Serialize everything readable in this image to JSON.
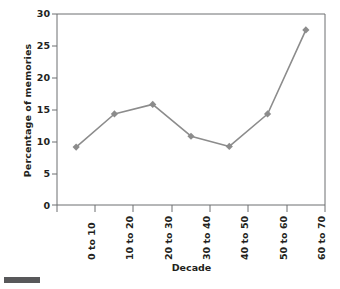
{
  "chart_data": {
    "type": "line",
    "title": "",
    "subtitle": "",
    "xlabel": "Decade",
    "ylabel": "Percentage of memories",
    "categories": [
      "0 to 10",
      "10 to 20",
      "20 to 30",
      "30 to 40",
      "40 to 50",
      "50 to 60",
      "60 to 70"
    ],
    "values": [
      9.1,
      14.3,
      15.8,
      10.8,
      9.2,
      14.3,
      27.5
    ],
    "series": [
      {
        "name": "Percentage of memories",
        "values": [
          9.1,
          14.3,
          15.8,
          10.8,
          9.2,
          14.3,
          27.5
        ]
      }
    ],
    "ylim": [
      0,
      30
    ],
    "y_ticks": [
      0,
      5,
      10,
      15,
      20,
      25,
      30
    ],
    "y_tick_labels": [
      "0",
      "5",
      "10",
      "15",
      "20",
      "25",
      "30"
    ],
    "grid": false,
    "legend": false,
    "legend_position": "none",
    "marker": "diamond",
    "line_color": "#8c8c8c",
    "marker_color": "#8c8c8c",
    "axis_color": "#6d6e71",
    "text_color": "#231f20",
    "background": "#ffffff"
  }
}
